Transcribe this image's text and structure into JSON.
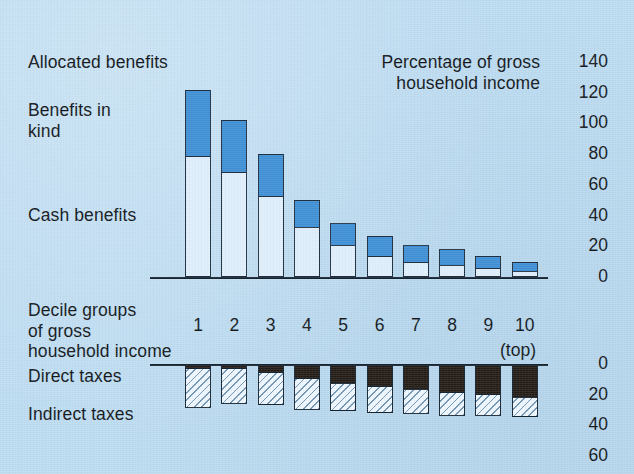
{
  "figure": {
    "upper_legend": [
      {
        "key": "allocated",
        "label": "Allocated benefits"
      },
      {
        "key": "kind",
        "label": "Benefits in\nkind"
      },
      {
        "key": "cash",
        "label": "Cash benefits"
      }
    ],
    "upper_title": "Percentage of gross\nhousehold income",
    "category_axis_title": "Decile groups\nof gross\nhousehold income",
    "top_note": "(top)",
    "lower_legend": [
      {
        "key": "direct",
        "label": "Direct taxes"
      },
      {
        "key": "indirect",
        "label": "Indirect taxes"
      }
    ],
    "colors": {
      "background": "#bcdbf0",
      "benefits_in_kind": "#3d8ed4",
      "cash_benefits": "#dfeefb",
      "direct_taxes": "#221a14",
      "indirect_taxes": "#eef6fd",
      "ink": "#14212e"
    }
  },
  "chart_data": {
    "type": "bar",
    "title": "Percentage of gross household income",
    "subtype": "stacked-bar, mirrored dual-panel",
    "xlabel": "Decile groups of gross household income",
    "ylabel": "Percentage of gross household income",
    "categories": [
      "1",
      "2",
      "3",
      "4",
      "5",
      "6",
      "7",
      "8",
      "9",
      "10"
    ],
    "category_note": "10 = top decile",
    "grid": false,
    "legend_position": "left",
    "panels": [
      {
        "name": "Allocated benefits",
        "position": "upper",
        "ylim": [
          0,
          140
        ],
        "yticks": [
          0,
          20,
          40,
          60,
          80,
          100,
          120,
          140
        ],
        "direction": "up",
        "series": [
          {
            "name": "Cash benefits",
            "values": [
              79,
              69,
              53,
              33,
              21,
              14,
              10,
              8,
              6,
              4
            ]
          },
          {
            "name": "Benefits in kind",
            "values": [
              43,
              33,
              27,
              17,
              14,
              13,
              11,
              10,
              8,
              6
            ]
          }
        ],
        "totals": [
          122,
          102,
          80,
          50,
          35,
          27,
          21,
          18,
          14,
          10
        ]
      },
      {
        "name": "Taxes",
        "position": "lower",
        "ylim": [
          0,
          60
        ],
        "yticks": [
          0,
          20,
          40,
          60
        ],
        "direction": "down",
        "series": [
          {
            "name": "Direct taxes",
            "values": [
              2,
              2,
              5,
              9,
              12,
              14,
              16,
              18,
              19,
              21
            ]
          },
          {
            "name": "Indirect taxes",
            "values": [
              27,
              24,
              22,
              21,
              19,
              18,
              17,
              16,
              15,
              14
            ]
          }
        ],
        "totals": [
          29,
          26,
          27,
          30,
          31,
          32,
          33,
          34,
          34,
          35
        ]
      }
    ]
  },
  "axes": {
    "upper_ticks": [
      "140",
      "120",
      "100",
      "80",
      "60",
      "40",
      "20",
      "0"
    ],
    "lower_ticks": [
      "0",
      "20",
      "40",
      "60"
    ],
    "decile_labels": [
      "1",
      "2",
      "3",
      "4",
      "5",
      "6",
      "7",
      "8",
      "9",
      "10"
    ]
  }
}
